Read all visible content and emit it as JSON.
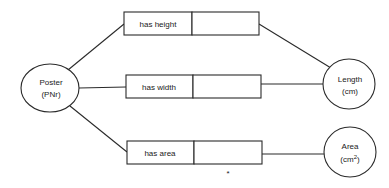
{
  "diagram": {
    "entities": [
      {
        "id": "poster",
        "name": "Poster",
        "unit": "(PNr)"
      },
      {
        "id": "length",
        "name": "Length",
        "unit": "(cm)"
      },
      {
        "id": "area",
        "name": "Area",
        "unit_prefix": "(cm",
        "unit_sup": "2",
        "unit_suffix": ")"
      }
    ],
    "relations": [
      {
        "id": "has-height",
        "label": "has height",
        "from": "poster",
        "to": "length"
      },
      {
        "id": "has-width",
        "label": "has width",
        "from": "poster",
        "to": "length"
      },
      {
        "id": "has-area",
        "label": "has area",
        "from": "poster",
        "to": "area"
      }
    ],
    "annotation": "*"
  }
}
